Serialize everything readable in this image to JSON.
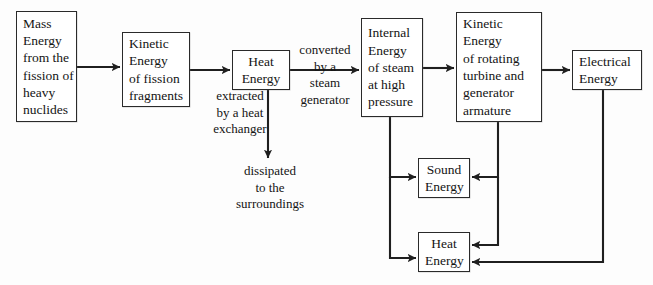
{
  "diagram": {
    "type": "flow-diagram",
    "stroke_color": "#2a2a2a",
    "background_color": "#fdfdfd",
    "nodes": [
      {
        "id": "mass-energy",
        "lines": [
          "Mass",
          "Energy",
          "from the",
          "fission of",
          "heavy",
          "nuclides"
        ],
        "x": 16,
        "y": 11,
        "w": 61,
        "h": 111,
        "align": "left"
      },
      {
        "id": "kinetic-fission",
        "lines": [
          "Kinetic",
          "Energy",
          "of fission",
          "fragments"
        ],
        "x": 122,
        "y": 32,
        "w": 68,
        "h": 75,
        "align": "left"
      },
      {
        "id": "heat-energy-top",
        "lines": [
          "Heat",
          "Energy"
        ],
        "x": 232,
        "y": 50,
        "w": 58,
        "h": 40,
        "align": "center"
      },
      {
        "id": "internal-energy",
        "lines": [
          "Internal",
          "Energy",
          "of steam",
          "at high",
          "pressure"
        ],
        "x": 361,
        "y": 18,
        "w": 62,
        "h": 99,
        "align": "left"
      },
      {
        "id": "kinetic-turbine",
        "lines": [
          "Kinetic",
          "Energy",
          "of rotating",
          "turbine and",
          "generator",
          "armature"
        ],
        "x": 456,
        "y": 12,
        "w": 86,
        "h": 110,
        "align": "left"
      },
      {
        "id": "electrical-energy",
        "lines": [
          "Electrical",
          "Energy"
        ],
        "x": 572,
        "y": 50,
        "w": 70,
        "h": 40,
        "align": "left"
      },
      {
        "id": "sound-energy",
        "lines": [
          "Sound",
          "Energy"
        ],
        "x": 418,
        "y": 158,
        "w": 52,
        "h": 40,
        "align": "center"
      },
      {
        "id": "heat-energy-bottom",
        "lines": [
          "Heat",
          "Energy"
        ],
        "x": 418,
        "y": 232,
        "w": 52,
        "h": 40,
        "align": "center"
      }
    ],
    "edge_labels": [
      {
        "id": "extracted-by-heat-exchanger",
        "lines": [
          "extracted",
          "by a heat",
          "exchanger"
        ],
        "x": 192,
        "y": 88,
        "w": 96
      },
      {
        "id": "converted-by-steam-generator",
        "lines": [
          "converted",
          "by a",
          "steam",
          "generator"
        ],
        "x": 286,
        "y": 42,
        "w": 78
      },
      {
        "id": "dissipated-to-surroundings",
        "lines": [
          "dissipated",
          "to the",
          "surroundings"
        ],
        "x": 208,
        "y": 163,
        "w": 124
      }
    ],
    "edges": [
      {
        "id": "mass-to-kinetic-fission",
        "from": "mass-energy",
        "to": "kinetic-fission"
      },
      {
        "id": "kinetic-fission-to-heat",
        "from": "kinetic-fission",
        "to": "heat-energy-top"
      },
      {
        "id": "heat-to-internal",
        "from": "heat-energy-top",
        "to": "internal-energy"
      },
      {
        "id": "internal-to-kinetic-turbine",
        "from": "internal-energy",
        "to": "kinetic-turbine"
      },
      {
        "id": "kinetic-turbine-to-electrical",
        "from": "kinetic-turbine",
        "to": "electrical-energy"
      },
      {
        "id": "heat-to-surroundings",
        "from": "heat-energy-top",
        "to": "dissipated-to-surroundings"
      },
      {
        "id": "internal-to-sound",
        "from": "internal-energy",
        "to": "sound-energy"
      },
      {
        "id": "internal-to-heat-bottom",
        "from": "internal-energy",
        "to": "heat-energy-bottom"
      },
      {
        "id": "kinetic-turbine-to-sound",
        "from": "kinetic-turbine",
        "to": "sound-energy"
      },
      {
        "id": "kinetic-turbine-to-heat-bottom",
        "from": "kinetic-turbine",
        "to": "heat-energy-bottom"
      },
      {
        "id": "electrical-to-heat-bottom",
        "from": "electrical-energy",
        "to": "heat-energy-bottom"
      }
    ]
  }
}
